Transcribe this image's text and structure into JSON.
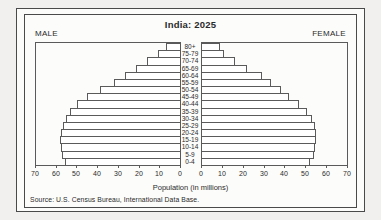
{
  "figure": {
    "title": "India: 2025",
    "male_label": "MALE",
    "female_label": "FEMALE",
    "xlabel": "Population (in millions)",
    "source": "Source: U.S. Census Bureau, International Data Base."
  },
  "colors": {
    "page_bg": "#f1f0ee",
    "paper_bg": "#fcfcfa",
    "frame": "#4a4a4a",
    "bar_outline": "#5a5a5a",
    "bar_fill": "#ffffff",
    "text": "#2a2a2a"
  },
  "chart_data": {
    "type": "bar",
    "subtype": "population-pyramid",
    "title": "India: 2025",
    "xlabel": "Population (in millions)",
    "categories": [
      "80+",
      "75-79",
      "70-74",
      "65-69",
      "60-64",
      "55-59",
      "50-54",
      "45-49",
      "40-44",
      "35-39",
      "30-34",
      "25-29",
      "20-24",
      "15-19",
      "10-14",
      "5-9",
      "0-4"
    ],
    "series": [
      {
        "name": "Male",
        "side": "left",
        "values": [
          7,
          10.5,
          16,
          21.5,
          26.5,
          32,
          39,
          45,
          50,
          53.5,
          55.5,
          57,
          58,
          58.5,
          58,
          57.5,
          56
        ]
      },
      {
        "name": "Female",
        "side": "right",
        "values": [
          8.5,
          10.5,
          16,
          21.5,
          29,
          33.5,
          38,
          42,
          47,
          50.5,
          53,
          54.5,
          55,
          55,
          54.5,
          54,
          52
        ]
      }
    ],
    "axis": {
      "ticks": [
        0,
        10,
        20,
        30,
        40,
        50,
        60,
        70
      ],
      "max": 70,
      "unit": "millions",
      "grid": false
    },
    "legend": "none",
    "source": "Source: U.S. Census Bureau, International Data Base."
  }
}
